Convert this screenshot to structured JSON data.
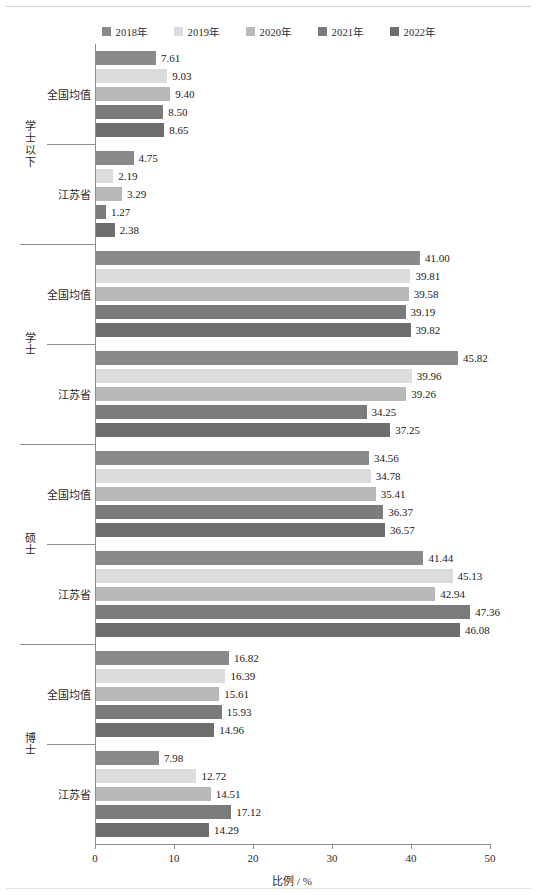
{
  "chart_data": {
    "type": "bar",
    "orientation": "horizontal",
    "title": "",
    "xlabel": "比例 / %",
    "ylabel": "",
    "xlim": [
      0,
      50
    ],
    "xticks": [
      0,
      10,
      20,
      30,
      40,
      50
    ],
    "xtick_labels": [
      "0",
      "10",
      "20",
      "30",
      "40",
      "50"
    ],
    "grid": false,
    "legend_position": "top-center",
    "series": [
      {
        "name": "2018年",
        "color": "#8a8a8a"
      },
      {
        "name": "2019年",
        "color": "#dcdcdc"
      },
      {
        "name": "2020年",
        "color": "#b9b9b9"
      },
      {
        "name": "2021年",
        "color": "#7b7b7b"
      },
      {
        "name": "2022年",
        "color": "#6e6e6e"
      }
    ],
    "groups": [
      {
        "label": "学士以下",
        "subgroups": [
          {
            "label": "全国均值",
            "values": [
              7.61,
              9.03,
              9.4,
              8.5,
              8.65
            ],
            "value_labels": [
              "7.61",
              "9.03",
              "9.40",
              "8.50",
              "8.65"
            ]
          },
          {
            "label": "江苏省",
            "values": [
              4.75,
              2.19,
              3.29,
              1.27,
              2.38
            ],
            "value_labels": [
              "4.75",
              "2.19",
              "3.29",
              "1.27",
              "2.38"
            ]
          }
        ]
      },
      {
        "label": "学士",
        "subgroups": [
          {
            "label": "全国均值",
            "values": [
              41.0,
              39.81,
              39.58,
              39.19,
              39.82
            ],
            "value_labels": [
              "41.00",
              "39.81",
              "39.58",
              "39.19",
              "39.82"
            ]
          },
          {
            "label": "江苏省",
            "values": [
              45.82,
              39.96,
              39.26,
              34.25,
              37.25
            ],
            "value_labels": [
              "45.82",
              "39.96",
              "39.26",
              "34.25",
              "37.25"
            ]
          }
        ]
      },
      {
        "label": "硕士",
        "subgroups": [
          {
            "label": "全国均值",
            "values": [
              34.56,
              34.78,
              35.41,
              36.37,
              36.57
            ],
            "value_labels": [
              "34.56",
              "34.78",
              "35.41",
              "36.37",
              "36.57"
            ]
          },
          {
            "label": "江苏省",
            "values": [
              41.44,
              45.13,
              42.94,
              47.36,
              46.08
            ],
            "value_labels": [
              "41.44",
              "45.13",
              "42.94",
              "47.36",
              "46.08"
            ]
          }
        ]
      },
      {
        "label": "博士",
        "subgroups": [
          {
            "label": "全国均值",
            "values": [
              16.82,
              16.39,
              15.61,
              15.93,
              14.96
            ],
            "value_labels": [
              "16.82",
              "16.39",
              "15.61",
              "15.93",
              "14.96"
            ]
          },
          {
            "label": "江苏省",
            "values": [
              7.98,
              12.72,
              14.51,
              17.12,
              14.29
            ],
            "value_labels": [
              "7.98",
              "12.72",
              "14.51",
              "17.12",
              "14.29"
            ]
          }
        ]
      }
    ]
  }
}
